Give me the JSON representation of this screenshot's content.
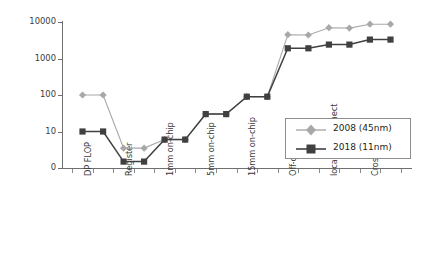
{
  "chart_data": {
    "type": "line",
    "title": "",
    "xlabel": "",
    "ylabel": "Picojoules Per 64bit operation",
    "yscale": "log",
    "ylim": [
      0,
      10000
    ],
    "ytick_labels": [
      "10000",
      "1000",
      "100",
      "10",
      "0"
    ],
    "ytick_values": [
      10000,
      1000,
      100,
      10,
      0
    ],
    "grid": false,
    "legend_position": "center-right",
    "categories": [
      "DP FLOP",
      "Register",
      "1mm on-chip",
      "5mm on-chip",
      "15mm on-chip",
      "Off-chip/DRAM",
      "local interconnect",
      "Cross system"
    ],
    "series": [
      {
        "name": "2008 (45nm)",
        "color": "#a8a8a8",
        "marker": "diamond",
        "values": [
          100,
          3.5,
          6,
          30,
          90,
          4500,
          7000,
          9000
        ],
        "step_values": [
          100,
          100,
          3.5,
          3.5,
          6,
          6,
          30,
          30,
          90,
          90,
          4500,
          4400,
          7000,
          6800,
          8700,
          8700
        ]
      },
      {
        "name": "2018 (11nm)",
        "color": "#404040",
        "marker": "square",
        "values": [
          10,
          1.5,
          6,
          30,
          90,
          1900,
          2400,
          3300
        ],
        "step_values": [
          10,
          10,
          1.5,
          1.5,
          6,
          6,
          30,
          30,
          90,
          90,
          1900,
          1900,
          2400,
          2400,
          3300,
          3300
        ]
      }
    ]
  },
  "legend": {
    "entries": [
      {
        "label": "2008 (45nm)"
      },
      {
        "label": "2018 (11nm)"
      }
    ]
  },
  "axes": {
    "y_title": "Picojoules Per 64bit operation"
  }
}
